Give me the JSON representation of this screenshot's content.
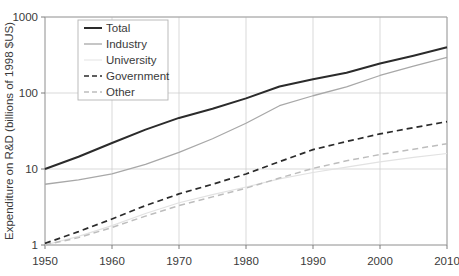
{
  "chart_data": {
    "type": "line",
    "title": "",
    "xlabel": "",
    "ylabel": "Expenditure on R&D (billions of 1998 $US)",
    "yscale": "log",
    "ylim": [
      1,
      1000
    ],
    "xlim": [
      1950,
      2010
    ],
    "grid": true,
    "legend_position": "top-left",
    "x_ticks": [
      "1950",
      "1960",
      "1970",
      "1980",
      "1990",
      "2000",
      "2010"
    ],
    "x_tick_values": [
      1950,
      1960,
      1970,
      1980,
      1990,
      2000,
      2010
    ],
    "y_ticks": [
      "1",
      "10",
      "100",
      "1000"
    ],
    "y_tick_values": [
      1,
      10,
      100,
      1000
    ],
    "x": [
      1950,
      1955,
      1960,
      1965,
      1970,
      1975,
      1980,
      1985,
      1990,
      1995,
      2000,
      2005,
      2010
    ],
    "series": [
      {
        "name": "Total",
        "color": "#2b2b2b",
        "width": 2.0,
        "dash": "none",
        "values": [
          10.0,
          14.5,
          22.0,
          33.0,
          47.0,
          62.0,
          85.0,
          122.0,
          152.0,
          185.0,
          245.0,
          310.0,
          400.0
        ]
      },
      {
        "name": "Industry",
        "color": "#a8a8a8",
        "width": 1.3,
        "dash": "none",
        "values": [
          6.3,
          7.2,
          8.6,
          11.5,
          16.5,
          25.0,
          40.0,
          68.0,
          92.0,
          120.0,
          170.0,
          225.0,
          295.0
        ]
      },
      {
        "name": "University",
        "color": "#e2e2e2",
        "width": 1.2,
        "dash": "none",
        "values": [
          1.0,
          1.3,
          1.8,
          2.6,
          3.6,
          4.6,
          5.8,
          7.4,
          9.0,
          10.6,
          12.4,
          14.2,
          16.0
        ]
      },
      {
        "name": "Government",
        "color": "#2b2b2b",
        "width": 1.7,
        "dash": "6,4",
        "values": [
          1.05,
          1.5,
          2.2,
          3.3,
          4.7,
          6.3,
          8.6,
          12.5,
          18.0,
          23.0,
          29.0,
          35.0,
          42.0
        ]
      },
      {
        "name": "Other",
        "color": "#bdbdbd",
        "width": 1.5,
        "dash": "6,4",
        "values": [
          1.0,
          1.25,
          1.7,
          2.4,
          3.3,
          4.3,
          5.6,
          7.6,
          10.2,
          12.8,
          15.5,
          18.2,
          21.5
        ]
      }
    ],
    "legend_entries": [
      {
        "label": "Total",
        "color": "#2b2b2b",
        "width": 2.0,
        "dash": "none"
      },
      {
        "label": "Industry",
        "color": "#a8a8a8",
        "width": 1.3,
        "dash": "none"
      },
      {
        "label": "University",
        "color": "#e8e8e8",
        "width": 1.2,
        "dash": "none"
      },
      {
        "label": "Government",
        "color": "#2b2b2b",
        "width": 1.7,
        "dash": "5,3"
      },
      {
        "label": "Other",
        "color": "#bdbdbd",
        "width": 1.5,
        "dash": "5,3"
      }
    ]
  },
  "layout": {
    "plot_left": 45,
    "plot_right": 447,
    "plot_top": 17,
    "plot_bottom": 245,
    "legend_x": 78,
    "legend_y": 20,
    "legend_w": 90,
    "legend_h": 80
  }
}
